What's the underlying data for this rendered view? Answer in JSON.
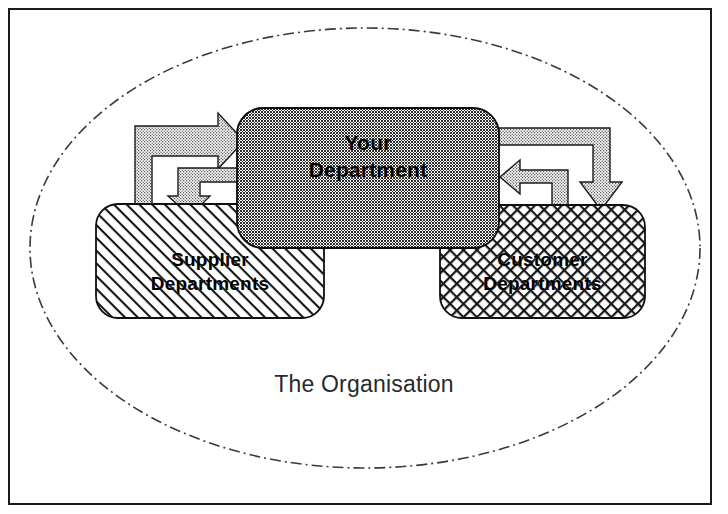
{
  "diagram": {
    "container": {
      "name": "organisation-ellipse",
      "label": "The Organisation",
      "border_style": "dash-dot",
      "border_color": "#3a3a3a",
      "fill": "#ffffff",
      "center": {
        "x": 365,
        "y": 248
      },
      "radius": {
        "rx": 335,
        "ry": 220
      }
    },
    "frame": {
      "border_color": "#1b1b1b",
      "border_width_px": 2,
      "fill": "#ffffff"
    },
    "nodes": [
      {
        "id": "your-department",
        "label": "Your\nDepartment",
        "fill_pattern": "dark-checkerboard",
        "fill_color": "#4d4d4d",
        "text_color": "#000000",
        "x": 237,
        "y": 108,
        "width": 262,
        "height": 140
      },
      {
        "id": "supplier-departments",
        "label": "Supplier\nDepartments",
        "fill_pattern": "diagonal-hatch",
        "fill_color": "#ffffff",
        "text_color": "#000000",
        "x": 96,
        "y": 204,
        "width": 228,
        "height": 114
      },
      {
        "id": "customer-departments",
        "label": "Customer\nDepartments",
        "fill_pattern": "diagonal-crosshatch",
        "fill_color": "#ffffff",
        "text_color": "#000000",
        "x": 440,
        "y": 205,
        "width": 205,
        "height": 113
      }
    ],
    "connectors": [
      {
        "id": "supplier-to-your",
        "from": "supplier-departments",
        "to": "your-department",
        "direction": "up-then-right",
        "arrowhead": "right",
        "fill_pattern": "light-stipple"
      },
      {
        "id": "your-to-supplier",
        "from": "your-department",
        "to": "supplier-departments",
        "direction": "left-then-down",
        "arrowhead": "down",
        "fill_pattern": "light-stipple"
      },
      {
        "id": "your-to-customer",
        "from": "your-department",
        "to": "customer-departments",
        "direction": "right-then-down",
        "arrowhead": "down",
        "fill_pattern": "light-stipple"
      },
      {
        "id": "customer-to-your",
        "from": "customer-departments",
        "to": "your-department",
        "direction": "up-then-left",
        "arrowhead": "left",
        "fill_pattern": "light-stipple"
      }
    ]
  }
}
